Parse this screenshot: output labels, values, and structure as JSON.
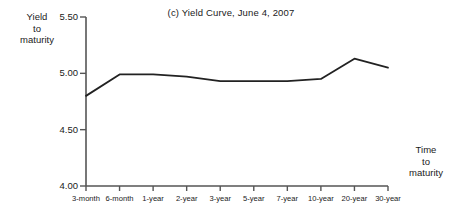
{
  "figure": {
    "title": "(c) Yield Curve, June 4, 2007",
    "y_axis_label_line1": "Yield",
    "y_axis_label_line2": "to",
    "y_axis_label_line3": "maturity",
    "x_axis_label_line1": "Time",
    "x_axis_label_line2": "to",
    "x_axis_label_line3": "maturity",
    "line_color": "#222222",
    "axis_color": "#555555",
    "background_color": "#ffffff"
  },
  "chart_data": {
    "type": "line",
    "title": "(c) Yield Curve, June 4, 2007",
    "xlabel": "Time to maturity",
    "ylabel": "Yield to maturity",
    "categories": [
      "3-month",
      "6-month",
      "1-year",
      "2-year",
      "3-year",
      "5-year",
      "7-year",
      "10-year",
      "20-year",
      "30-year"
    ],
    "values": [
      4.8,
      4.99,
      4.99,
      4.97,
      4.93,
      4.93,
      4.93,
      4.95,
      5.13,
      5.05
    ],
    "ylim": [
      4.0,
      5.5
    ],
    "yticks": [
      4.0,
      4.5,
      5.0,
      5.5
    ],
    "ytick_labels": [
      "4.00",
      "4.50",
      "5.00",
      "5.50"
    ],
    "grid": false,
    "legend": false,
    "series": [
      {
        "name": "Yield curve",
        "values": [
          4.8,
          4.99,
          4.99,
          4.97,
          4.93,
          4.93,
          4.93,
          4.95,
          5.13,
          5.05
        ]
      }
    ]
  }
}
